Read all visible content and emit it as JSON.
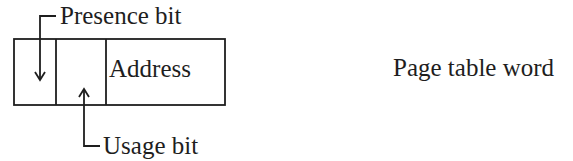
{
  "diagram": {
    "title": "Page table word",
    "word": {
      "fields": [
        {
          "name": "presence",
          "label": ""
        },
        {
          "name": "usage",
          "label": ""
        },
        {
          "name": "address",
          "label": "Address"
        }
      ]
    },
    "callouts": {
      "presence": "Presence bit",
      "usage": "Usage bit"
    },
    "colors": {
      "ink": "#1e1e1e",
      "background": "#ffffff"
    }
  }
}
